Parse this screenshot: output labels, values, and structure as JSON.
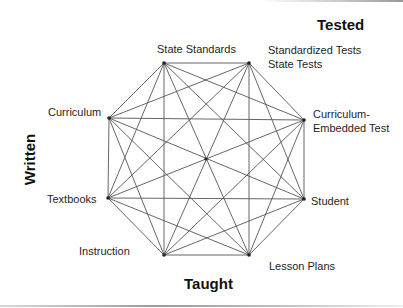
{
  "diagram": {
    "type": "complete-graph-octagon",
    "axis_labels": {
      "tested": "Tested",
      "written": "Written",
      "taught": "Taught"
    },
    "nodes": [
      {
        "id": "state-standards",
        "label": "State Standards",
        "x": 164,
        "y": 63
      },
      {
        "id": "standardized-tests",
        "label": "Standardized Tests",
        "label2": "State Tests",
        "x": 249,
        "y": 63
      },
      {
        "id": "curriculum-embedded-test",
        "label": "Curriculum-",
        "label2": "Embedded Test",
        "x": 304,
        "y": 120
      },
      {
        "id": "student",
        "label": "Student",
        "x": 304,
        "y": 199
      },
      {
        "id": "lesson-plans",
        "label": "Lesson Plans",
        "x": 249,
        "y": 255
      },
      {
        "id": "instruction",
        "label": "Instruction",
        "x": 164,
        "y": 255
      },
      {
        "id": "textbooks",
        "label": "Textbooks",
        "x": 108,
        "y": 198
      },
      {
        "id": "curriculum",
        "label": "Curriculum",
        "x": 109,
        "y": 118
      }
    ],
    "center_node": {
      "x": 206,
      "y": 159
    },
    "edges": "all-pairs",
    "colors": {
      "line": "#555555",
      "node": "#222222",
      "text": "#1e1e1e",
      "axis_text": "#111111"
    }
  }
}
